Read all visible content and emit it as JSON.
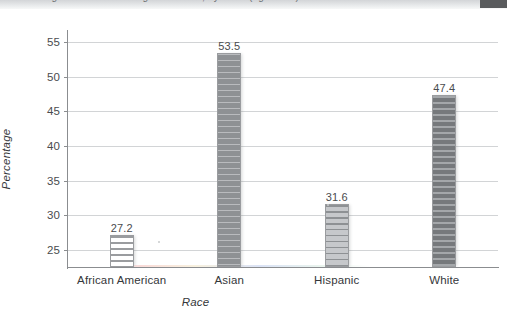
{
  "header": {
    "cut_off_title": "Percentage of Bachelor's Degree Holders, by Race (ages 25+)",
    "corner_block_color": "#595b5d"
  },
  "chart_data": {
    "type": "bar",
    "title": "",
    "subtitle": "",
    "xlabel": "Race",
    "ylabel": "Percentage",
    "categories": [
      "African American",
      "Asian",
      "Hispanic",
      "White"
    ],
    "values": [
      27.2,
      53.5,
      31.6,
      47.4
    ],
    "data_labels": [
      "27.2",
      "53.5",
      "31.6",
      "47.4"
    ],
    "ylim": [
      22.5,
      56.5
    ],
    "yticks": [
      25,
      30,
      35,
      40,
      45,
      50,
      55
    ],
    "ytick_labels": [
      "25",
      "30",
      "35",
      "40",
      "45",
      "50",
      "55"
    ],
    "grid": true,
    "grid_axis": "y",
    "legend": null,
    "legend_position": "none",
    "bar_styles": [
      {
        "category": "African American",
        "fill": "#ffffff",
        "stripe": "#9a9c9f",
        "note": "white with horizontal hatch"
      },
      {
        "category": "Asian",
        "fill": "#8e9194",
        "stripe": "#b9bbbe",
        "note": "medium gray with horizontal hatch"
      },
      {
        "category": "Hispanic",
        "fill": "#c6c8cb",
        "stripe": "#8e9194",
        "note": "light gray with horizontal hatch"
      },
      {
        "category": "White",
        "fill": "#76797c",
        "stripe": "#a4a7aa",
        "note": "dark gray with horizontal hatch"
      }
    ],
    "axis_color": "#8b8d90",
    "gridline_color": "#d2d4d6",
    "text_color": "#35373a",
    "background": "#ffffff"
  }
}
